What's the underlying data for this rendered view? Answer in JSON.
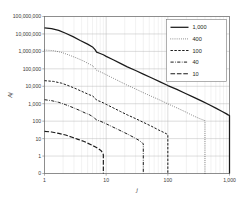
{
  "chart_data": {
    "type": "line",
    "title": "",
    "xlabel": "j",
    "ylabel": "Aj",
    "xscale": "log",
    "yscale": "log-with-zero",
    "xlim": [
      1,
      1000
    ],
    "ylim": [
      0,
      100000000
    ],
    "grid": true,
    "legend_position": "top-right",
    "xtick_labels": [
      "1",
      "10",
      "100",
      "1,000"
    ],
    "xtick_values": [
      1,
      10,
      100,
      1000
    ],
    "ytick_labels": [
      "100,000,000",
      "10,000,000",
      "1,000,000",
      "100,000",
      "10,000",
      "1,000",
      "100",
      "10",
      "1",
      "0"
    ],
    "ytick_values": [
      100000000,
      10000000,
      1000000,
      100000,
      10000,
      1000,
      100,
      10,
      1,
      0
    ],
    "series": [
      {
        "name": "1,000",
        "style": "solid",
        "width": 1.25,
        "drop_to_zero_at": 1000,
        "points": [
          [
            1,
            22000000
          ],
          [
            1.3,
            20000000
          ],
          [
            1.7,
            16000000
          ],
          [
            2.2,
            11000000
          ],
          [
            2.9,
            7000000
          ],
          [
            3.8,
            4200000
          ],
          [
            5,
            2600000
          ],
          [
            6,
            1800000
          ],
          [
            6.6,
            1250000
          ],
          [
            7,
            900000
          ],
          [
            8,
            760000
          ],
          [
            9,
            640000
          ],
          [
            10,
            520000
          ],
          [
            13,
            330000
          ],
          [
            17,
            205000
          ],
          [
            22,
            130000
          ],
          [
            30,
            80000
          ],
          [
            40,
            50000
          ],
          [
            55,
            30000
          ],
          [
            75,
            18000
          ],
          [
            100,
            11000
          ],
          [
            140,
            6600
          ],
          [
            190,
            4000
          ],
          [
            260,
            2400
          ],
          [
            350,
            1450
          ],
          [
            470,
            880
          ],
          [
            600,
            560
          ],
          [
            760,
            360
          ],
          [
            880,
            270
          ],
          [
            950,
            230
          ],
          [
            1000,
            210
          ]
        ]
      },
      {
        "name": "400",
        "style": "dotted",
        "width": 0.8,
        "drop_to_zero_at": 400,
        "points": [
          [
            1,
            1200000
          ],
          [
            1.4,
            1100000
          ],
          [
            1.9,
            870000
          ],
          [
            2.5,
            620000
          ],
          [
            3.3,
            420000
          ],
          [
            4.3,
            280000
          ],
          [
            5.3,
            190000
          ],
          [
            6,
            150000
          ],
          [
            6.6,
            110000
          ],
          [
            7,
            82000
          ],
          [
            8,
            68000
          ],
          [
            9,
            56000
          ],
          [
            10,
            46000
          ],
          [
            13,
            29000
          ],
          [
            17,
            18000
          ],
          [
            22,
            11500
          ],
          [
            30,
            7000
          ],
          [
            40,
            4300
          ],
          [
            55,
            2600
          ],
          [
            75,
            1600
          ],
          [
            100,
            980
          ],
          [
            140,
            580
          ],
          [
            190,
            350
          ],
          [
            250,
            215
          ],
          [
            320,
            145
          ],
          [
            380,
            115
          ],
          [
            400,
            105
          ]
        ]
      },
      {
        "name": "100",
        "style": "dashed",
        "width": 1.0,
        "drop_to_zero_at": 100,
        "points": [
          [
            1,
            21000
          ],
          [
            1.4,
            19000
          ],
          [
            1.9,
            15000
          ],
          [
            2.5,
            10500
          ],
          [
            3.3,
            7000
          ],
          [
            4.3,
            4600
          ],
          [
            5.3,
            3300
          ],
          [
            6,
            2800
          ],
          [
            6.6,
            2100
          ],
          [
            7,
            1600
          ],
          [
            8,
            1350
          ],
          [
            9,
            1120
          ],
          [
            10,
            920
          ],
          [
            13,
            580
          ],
          [
            17,
            360
          ],
          [
            22,
            230
          ],
          [
            30,
            140
          ],
          [
            40,
            86
          ],
          [
            55,
            50
          ],
          [
            70,
            32
          ],
          [
            85,
            23
          ],
          [
            95,
            19
          ],
          [
            100,
            17
          ]
        ]
      },
      {
        "name": "40",
        "style": "dashdot",
        "width": 1.0,
        "drop_to_zero_at": 40,
        "points": [
          [
            1,
            1700
          ],
          [
            1.3,
            1500
          ],
          [
            1.7,
            1200
          ],
          [
            2.2,
            880
          ],
          [
            2.9,
            600
          ],
          [
            3.8,
            400
          ],
          [
            4.6,
            290
          ],
          [
            5.3,
            240
          ],
          [
            6,
            185
          ],
          [
            6.6,
            140
          ],
          [
            7,
            118
          ],
          [
            8,
            100
          ],
          [
            9,
            84
          ],
          [
            11,
            60
          ],
          [
            14,
            40
          ],
          [
            18,
            26
          ],
          [
            23,
            17
          ],
          [
            29,
            11
          ],
          [
            34,
            8
          ],
          [
            38,
            6
          ],
          [
            40,
            5
          ]
        ]
      },
      {
        "name": "10",
        "style": "longdash",
        "width": 1.15,
        "drop_to_zero_at": 9,
        "points": [
          [
            1,
            26
          ],
          [
            1.3,
            24
          ],
          [
            1.7,
            20
          ],
          [
            2.2,
            16
          ],
          [
            2.8,
            12
          ],
          [
            3.5,
            9
          ],
          [
            4.3,
            7
          ],
          [
            5,
            5.5
          ],
          [
            5.8,
            4.3
          ],
          [
            6.6,
            3.4
          ],
          [
            7.4,
            2.7
          ],
          [
            8.2,
            2.1
          ],
          [
            8.7,
            1.6
          ],
          [
            9,
            1.2
          ]
        ]
      }
    ]
  },
  "legend": {
    "items": [
      {
        "label": "1,000"
      },
      {
        "label": "400"
      },
      {
        "label": "100"
      },
      {
        "label": "40"
      },
      {
        "label": "10"
      }
    ]
  }
}
